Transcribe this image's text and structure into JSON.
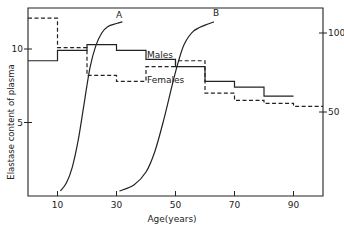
{
  "chart_data": {
    "type": "line",
    "title": "",
    "xlabel": "Age(years)",
    "ylabel": "Elastase content of plasma",
    "y2label": "",
    "xlim": [
      0,
      100
    ],
    "ylim": [
      0,
      13
    ],
    "y2lim": [
      0,
      110
    ],
    "grid": false,
    "x_ticks": [
      10,
      30,
      50,
      70,
      90
    ],
    "y_ticks": [
      5,
      10
    ],
    "y2_ticks": [
      50,
      100
    ],
    "series": [
      {
        "name": "Males",
        "style": "solid-step",
        "axis": "left",
        "bins": [
          [
            0,
            10
          ],
          [
            10,
            20
          ],
          [
            20,
            30
          ],
          [
            30,
            40
          ],
          [
            40,
            50
          ],
          [
            50,
            60
          ],
          [
            60,
            70
          ],
          [
            70,
            80
          ],
          [
            80,
            90
          ]
        ],
        "values": [
          9.2,
          9.9,
          10.3,
          9.9,
          9.3,
          8.8,
          7.8,
          7.4,
          6.8
        ]
      },
      {
        "name": "Females",
        "style": "dashed-step",
        "axis": "left",
        "bins": [
          [
            0,
            10
          ],
          [
            10,
            20
          ],
          [
            20,
            30
          ],
          [
            30,
            40
          ],
          [
            40,
            50
          ],
          [
            50,
            60
          ],
          [
            60,
            70
          ],
          [
            70,
            80
          ],
          [
            80,
            90
          ],
          [
            90,
            100
          ]
        ],
        "values": [
          12.1,
          10.1,
          8.2,
          7.8,
          8.8,
          9.2,
          7.0,
          6.5,
          6.3,
          6.1
        ]
      },
      {
        "name": "A",
        "style": "solid-curve",
        "axis": "right",
        "x": [
          11,
          13,
          15,
          17,
          19,
          21,
          23,
          25,
          27,
          30,
          32
        ],
        "values": [
          0,
          5,
          15,
          32,
          55,
          78,
          92,
          100,
          104,
          106,
          107
        ]
      },
      {
        "name": "B",
        "style": "solid-curve",
        "axis": "right",
        "x": [
          31,
          36,
          40,
          43,
          46,
          49,
          51,
          53,
          56,
          60,
          63
        ],
        "values": [
          0,
          4,
          12,
          25,
          45,
          68,
          82,
          93,
          101,
          105,
          107
        ]
      }
    ],
    "annotations": [
      "Males",
      "Females",
      "A",
      "B"
    ]
  }
}
